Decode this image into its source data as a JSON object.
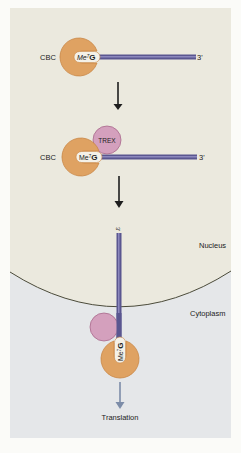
{
  "colors": {
    "nucleus_bg": "#ebe9de",
    "cytoplasm_bg": "#e5e7e9",
    "page_bg": "#fbfbf8",
    "cbc_fill": "#dfa262",
    "cbc_stroke": "#c98745",
    "trex_fill": "#d4a0bd",
    "trex_stroke": "#a86a8c",
    "mrna_fill": "#5a5690",
    "mrna_highlight": "#8c88bd",
    "arrow_black": "#1e1e1e",
    "arrow_translation": "#7c8ca8",
    "membrane": "#4b4b3a"
  },
  "step1": {
    "cbc_label": "CBC",
    "cap_label": "Me",
    "cap_sup": "7",
    "cap_g": "G",
    "three_prime": "3'"
  },
  "step2": {
    "cbc_label": "CBC",
    "trex_label": "TREX",
    "cap_label": "Me",
    "cap_sup": "7",
    "cap_g": "G",
    "three_prime": "3'"
  },
  "step3": {
    "three_prime": "3'",
    "cap_label": "Me",
    "cap_sup": "7",
    "cap_g": "G",
    "nucleus_label": "Nucleus",
    "cytoplasm_label": "Cytoplasm",
    "translation_label": "Translation"
  }
}
